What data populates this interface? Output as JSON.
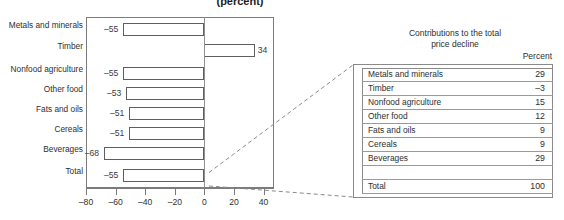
{
  "chart_data": {
    "type": "bar",
    "title": "(percent)",
    "orientation": "horizontal",
    "xlabel": "",
    "ylabel": "",
    "xlim": [
      -80,
      47
    ],
    "grid": false,
    "legend": "none",
    "categories": [
      "Metals and minerals",
      "Timber",
      "Nonfood agriculture",
      "Other food",
      "Fats and oils",
      "Cereals",
      "Beverages",
      "Total"
    ],
    "values": [
      -55,
      34,
      -55,
      -53,
      -51,
      -51,
      -68,
      -55
    ],
    "data_labels": [
      "–55",
      "34",
      "–55",
      "–53",
      "–51",
      "–51",
      "–68",
      "–55"
    ],
    "xticks": [
      -80,
      -60,
      -40,
      -20,
      0,
      20,
      40
    ],
    "xtick_labels": [
      "–80",
      "–60",
      "–40",
      "–20",
      "0",
      "20",
      "40"
    ]
  },
  "table": {
    "title_line1": "Contributions to the total",
    "title_line2": "price decline",
    "column_header": "Percent",
    "rows": [
      {
        "label": "Metals and minerals",
        "value": "29"
      },
      {
        "label": "Timber",
        "value": "–3"
      },
      {
        "label": "Nonfood agriculture",
        "value": "15"
      },
      {
        "label": "Other food",
        "value": "12"
      },
      {
        "label": "Fats and oils",
        "value": "9"
      },
      {
        "label": "Cereals",
        "value": "9"
      },
      {
        "label": "Beverages",
        "value": "29"
      }
    ],
    "total": {
      "label": "Total",
      "value": "100"
    }
  },
  "style": {
    "bar_outline": "#5f5f5f",
    "frame": "#7b7b7b",
    "text": "#2e2e2e",
    "connector": "#8a8a8a"
  }
}
